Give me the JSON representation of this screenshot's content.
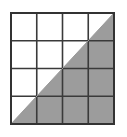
{
  "figure": {
    "title": "Four-by-four grid with diagonal half shaded",
    "type": "grid-fraction-diagram"
  },
  "canvas": {
    "width": 127,
    "height": 137,
    "background_color": "#ffffff"
  },
  "grid": {
    "rows": 4,
    "columns": 4,
    "total_cells": 16,
    "left": 11,
    "top": 13,
    "right": 114,
    "bottom": 124,
    "width": 103,
    "height": 111,
    "cell_width": 25.75,
    "cell_height": 27.75,
    "outer_border_color": "#333333",
    "outer_border_width": 2,
    "inner_line_color": "#3a3a3a",
    "inner_line_width": 1.6,
    "x_lines": [
      11,
      36.75,
      62.5,
      88.25,
      114
    ],
    "y_lines": [
      13,
      40.75,
      68.5,
      96.25,
      124
    ]
  },
  "diagonal": {
    "description": "line from bottom-left corner to top-right corner",
    "start_x": 11,
    "start_y": 124,
    "end_x": 114,
    "end_y": 13,
    "color": "#9a9a9a",
    "width": 1
  },
  "shading": {
    "region": "lower-right triangle",
    "fill_color": "#9c9c9c",
    "unshaded_fill_color": "#ffffff",
    "fraction_shaded": "1/2",
    "shaded_cell_equivalents": 8
  },
  "cells": [
    {
      "row": 1,
      "col": 1,
      "state": "unshaded"
    },
    {
      "row": 1,
      "col": 2,
      "state": "unshaded"
    },
    {
      "row": 1,
      "col": 3,
      "state": "unshaded"
    },
    {
      "row": 1,
      "col": 4,
      "state": "half-shaded"
    },
    {
      "row": 2,
      "col": 1,
      "state": "unshaded"
    },
    {
      "row": 2,
      "col": 2,
      "state": "unshaded"
    },
    {
      "row": 2,
      "col": 3,
      "state": "half-shaded"
    },
    {
      "row": 2,
      "col": 4,
      "state": "shaded"
    },
    {
      "row": 3,
      "col": 1,
      "state": "unshaded"
    },
    {
      "row": 3,
      "col": 2,
      "state": "half-shaded"
    },
    {
      "row": 3,
      "col": 3,
      "state": "shaded"
    },
    {
      "row": 3,
      "col": 4,
      "state": "shaded"
    },
    {
      "row": 4,
      "col": 1,
      "state": "half-shaded"
    },
    {
      "row": 4,
      "col": 2,
      "state": "shaded"
    },
    {
      "row": 4,
      "col": 3,
      "state": "shaded"
    },
    {
      "row": 4,
      "col": 4,
      "state": "shaded"
    }
  ]
}
